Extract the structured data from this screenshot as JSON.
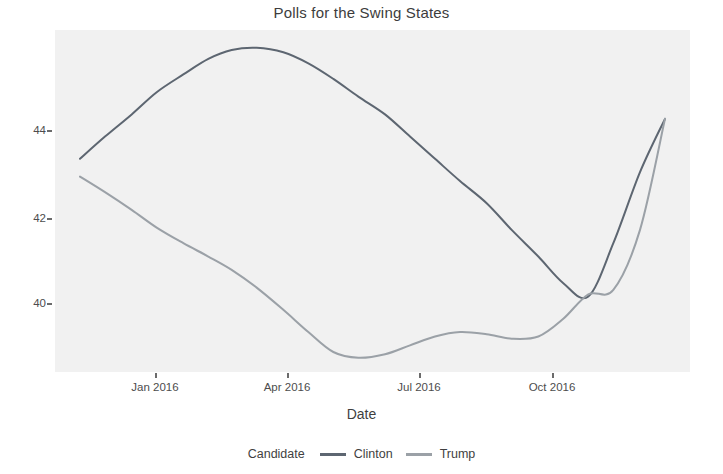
{
  "chart_data": {
    "type": "line",
    "title": "Polls for the Swing States",
    "xlabel": "Date",
    "ylabel": "",
    "legend_title": "Candidate",
    "legend_position": "bottom",
    "grid": false,
    "panel_color": "#f1f1f1",
    "xlim": [
      "2015-11-20",
      "2016-12-05"
    ],
    "ylim": [
      38.4,
      46.1
    ],
    "yticks": [
      40,
      42,
      44
    ],
    "ytick_labels": [
      "40",
      "42",
      "44"
    ],
    "xticks": [
      "2016-01-01",
      "2016-04-01",
      "2016-07-01",
      "2016-10-01"
    ],
    "xtick_labels": [
      "Jan 2016",
      "Apr 2016",
      "Jul 2016",
      "Oct 2016"
    ],
    "series": [
      {
        "name": "Clinton",
        "color": "#5d6671",
        "x": [
          "2015-12-05",
          "2015-12-20",
          "2016-01-05",
          "2016-01-20",
          "2016-02-05",
          "2016-02-20",
          "2016-03-05",
          "2016-03-20",
          "2016-04-05",
          "2016-04-20",
          "2016-05-05",
          "2016-05-20",
          "2016-06-05",
          "2016-06-20",
          "2016-07-05",
          "2016-07-20",
          "2016-08-05",
          "2016-08-20",
          "2016-09-05",
          "2016-09-20",
          "2016-10-05",
          "2016-10-20",
          "2016-11-05",
          "2016-11-20"
        ],
        "y": [
          43.2,
          43.7,
          44.2,
          44.7,
          45.1,
          45.45,
          45.65,
          45.7,
          45.6,
          45.35,
          45.0,
          44.6,
          44.2,
          43.7,
          43.2,
          42.7,
          42.2,
          41.6,
          41.0,
          40.4,
          40.1,
          41.3,
          42.9,
          44.1
        ]
      },
      {
        "name": "Trump",
        "color": "#9ba1a7",
        "x": [
          "2015-12-05",
          "2015-12-20",
          "2016-01-05",
          "2016-01-20",
          "2016-02-05",
          "2016-02-20",
          "2016-03-05",
          "2016-03-20",
          "2016-04-05",
          "2016-04-20",
          "2016-05-05",
          "2016-05-20",
          "2016-06-05",
          "2016-06-20",
          "2016-07-05",
          "2016-07-20",
          "2016-08-05",
          "2016-08-20",
          "2016-09-05",
          "2016-09-20",
          "2016-10-05",
          "2016-10-20",
          "2016-11-05",
          "2016-11-20"
        ],
        "y": [
          42.8,
          42.45,
          42.05,
          41.65,
          41.3,
          41.0,
          40.7,
          40.3,
          39.8,
          39.3,
          38.85,
          38.72,
          38.8,
          39.0,
          39.2,
          39.3,
          39.25,
          39.15,
          39.2,
          39.6,
          40.15,
          40.25,
          41.6,
          44.1
        ]
      }
    ],
    "annotations": {
      "clinton_peak": {
        "x": "2016-03-20",
        "y": 45.7
      },
      "trump_min": {
        "x": "2016-05-20",
        "y": 38.7
      },
      "crossover": {
        "x": "2016-10-05",
        "y": 40.1
      },
      "convergence": {
        "x": "2016-11-20",
        "y": 44.1
      }
    }
  },
  "axis": {
    "y_tick_0": "40",
    "y_tick_1": "42",
    "y_tick_2": "44",
    "x_tick_0": "Jan 2016",
    "x_tick_1": "Apr 2016",
    "x_tick_2": "Jul 2016",
    "x_tick_3": "Oct 2016",
    "x_title": "Date"
  },
  "title": "Polls for the Swing States",
  "legend": {
    "title": "Candidate",
    "entries": [
      {
        "label": "Clinton",
        "color": "#5d6671"
      },
      {
        "label": "Trump",
        "color": "#9ba1a7"
      }
    ]
  }
}
